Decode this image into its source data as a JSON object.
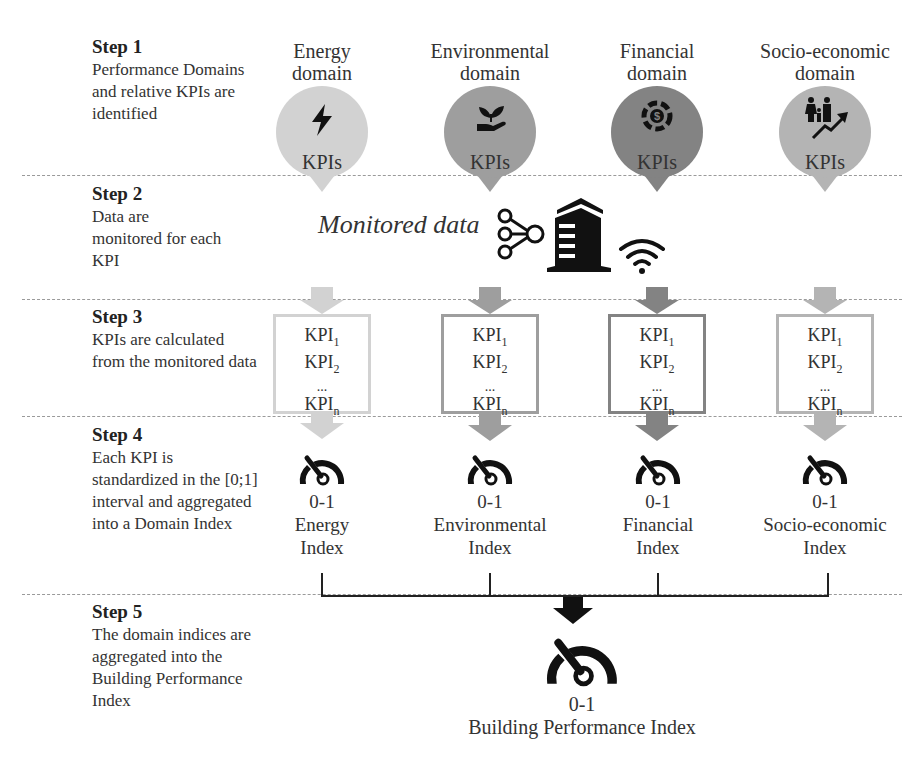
{
  "steps": [
    {
      "title": "Step 1",
      "text": "Performance Domains and relative KPIs are identified"
    },
    {
      "title": "Step 2",
      "text": "Data are monitored for each KPI"
    },
    {
      "title": "Step 3",
      "text": "KPIs are calculated from the monitored data"
    },
    {
      "title": "Step 4",
      "text": "Each KPI is standardized in the [0;1] interval and aggregated into a Domain Index"
    },
    {
      "title": "Step 5",
      "text": "The domain indices are aggregated into the Building Performance Index"
    }
  ],
  "domains": [
    {
      "title_line1": "Energy",
      "title_line2": "domain",
      "pin_label": "KPIs",
      "icon": "lightning-icon",
      "color": "#d2d2d2",
      "kpis": {
        "k1": "KPI",
        "k1sub": "1",
        "k2": "KPI",
        "k2sub": "2",
        "dots": "...",
        "kn": "KPI",
        "knsub": "n"
      },
      "index_value": "0-1",
      "index_line1": "Energy",
      "index_line2": "Index"
    },
    {
      "title_line1": "Environmental",
      "title_line2": "domain",
      "pin_label": "KPIs",
      "icon": "plant-in-hand-icon",
      "color": "#9e9e9e",
      "kpis": {
        "k1": "KPI",
        "k1sub": "1",
        "k2": "KPI",
        "k2sub": "2",
        "dots": "...",
        "kn": "KPI",
        "knsub": "n"
      },
      "index_value": "0-1",
      "index_line1": "Environmental",
      "index_line2": "Index"
    },
    {
      "title_line1": "Financial",
      "title_line2": "domain",
      "pin_label": "KPIs",
      "icon": "dollar-coin-icon",
      "color": "#838383",
      "kpis": {
        "k1": "KPI",
        "k1sub": "1",
        "k2": "KPI",
        "k2sub": "2",
        "dots": "...",
        "kn": "KPI",
        "knsub": "n"
      },
      "index_value": "0-1",
      "index_line1": "Financial",
      "index_line2": "Index"
    },
    {
      "title_line1": "Socio-economic",
      "title_line2": "domain",
      "pin_label": "KPIs",
      "icon": "family-growth-icon",
      "color": "#b4b4b4",
      "kpis": {
        "k1": "KPI",
        "k1sub": "1",
        "k2": "KPI",
        "k2sub": "2",
        "dots": "...",
        "kn": "KPI",
        "knsub": "n"
      },
      "index_value": "0-1",
      "index_line1": "Socio-economic",
      "index_line2": "Index"
    }
  ],
  "monitored": {
    "label": "Monitored data"
  },
  "bpi": {
    "value": "0-1",
    "label": "Building Performance Index"
  }
}
